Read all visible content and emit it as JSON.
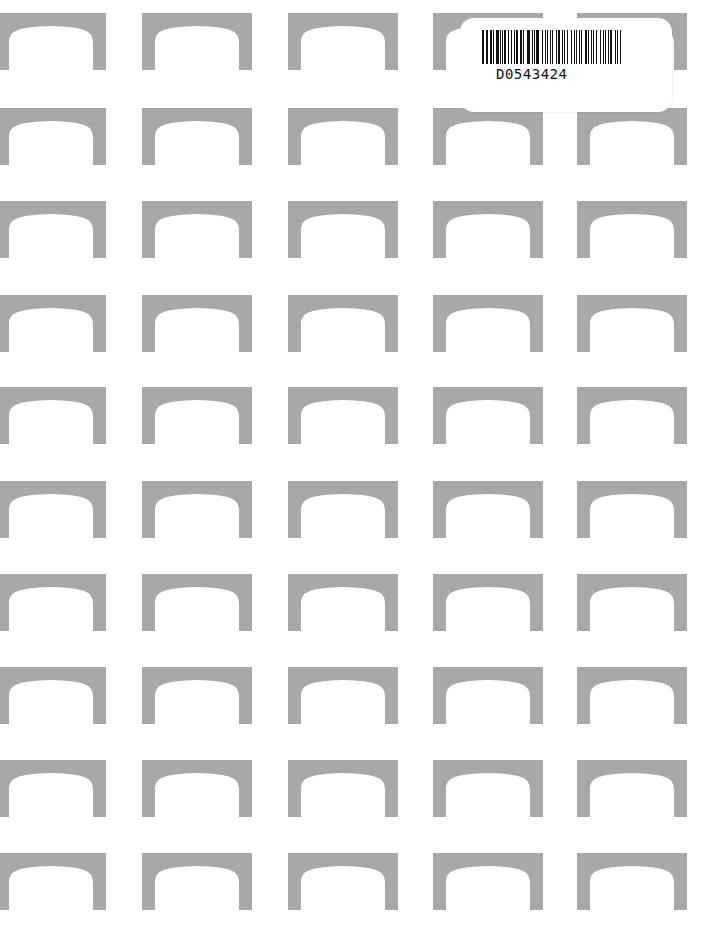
{
  "sheet": {
    "background": "#ffffff",
    "arch_color": "#a8a8a8",
    "columns_x": [
      -4,
      142,
      288,
      433,
      577
    ],
    "rows_y": [
      13,
      108,
      201,
      295,
      387,
      481,
      574,
      667,
      760,
      853
    ],
    "arch_width": 110,
    "arch_height": 57
  },
  "label": {
    "barcode_text": "D0543424",
    "bars": [
      2,
      1,
      1,
      2,
      1,
      3,
      1,
      1,
      2,
      1,
      1,
      1,
      3,
      2,
      1,
      1,
      2,
      1,
      1,
      3,
      1,
      2,
      1,
      1,
      2,
      1,
      3,
      1,
      1,
      2,
      1,
      1,
      2,
      1,
      1,
      3,
      1,
      1,
      2,
      1,
      1,
      2,
      1,
      1,
      3,
      1,
      2,
      1
    ]
  }
}
